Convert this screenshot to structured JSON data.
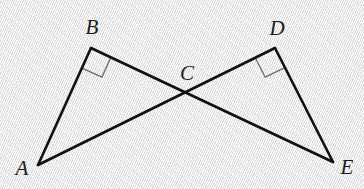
{
  "figure": {
    "type": "geometry-diagram",
    "canvas": {
      "width": 364,
      "height": 189
    },
    "background_color": "#ebebeb",
    "stroke_color": "#111111",
    "right_angle_color": "#6b6b6b",
    "stroke_width": 2.6,
    "points": [
      {
        "id": "A",
        "label": "A",
        "x": 38,
        "y": 165,
        "label_x": 22,
        "label_y": 168
      },
      {
        "id": "B",
        "label": "B",
        "x": 91,
        "y": 48,
        "label_x": 92,
        "label_y": 27
      },
      {
        "id": "C",
        "label": "C",
        "x": 186,
        "y": 91,
        "label_x": 187,
        "label_y": 73
      },
      {
        "id": "D",
        "label": "D",
        "x": 275,
        "y": 48,
        "label_x": 277,
        "label_y": 28
      },
      {
        "id": "E",
        "label": "E",
        "x": 333,
        "y": 162,
        "label_x": 347,
        "label_y": 167
      }
    ],
    "segments": [
      {
        "name": "segment-AB",
        "from": "A",
        "to": "B"
      },
      {
        "name": "segment-BE",
        "from": "B",
        "to": "E",
        "through": "C"
      },
      {
        "name": "segment-AD",
        "from": "A",
        "to": "D",
        "through": "C"
      },
      {
        "name": "segment-DE",
        "from": "D",
        "to": "E"
      }
    ],
    "right_angles": [
      {
        "name": "right-angle-at-B",
        "vertex": "B",
        "size": 22
      },
      {
        "name": "right-angle-at-D",
        "vertex": "D",
        "size": 22
      }
    ]
  }
}
